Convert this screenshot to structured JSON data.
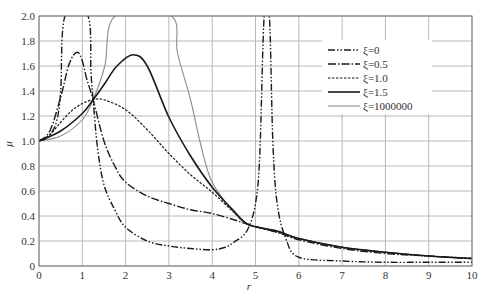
{
  "chart_data": {
    "type": "line",
    "title": "",
    "xlabel": "r",
    "ylabel": "μ",
    "xlim": [
      0,
      10
    ],
    "ylim": [
      0,
      2.0
    ],
    "grid": true,
    "legend_position": "upper right (inside)",
    "x_ticks": [
      "0",
      "1",
      "2",
      "3",
      "4",
      "5",
      "6",
      "7",
      "8",
      "9",
      "10"
    ],
    "y_ticks": [
      "0",
      "0.2",
      "0.4",
      "0.6",
      "0.8",
      "1.0",
      "1.2",
      "1.4",
      "1.6",
      "1.8",
      "2.0"
    ],
    "series": [
      {
        "name": "ξ=0",
        "style": "dash-dot-dot",
        "color": "#1a1a1a",
        "points": [
          [
            0,
            1.0
          ],
          [
            0.2,
            1.03
          ],
          [
            0.4,
            1.15
          ],
          [
            0.5,
            1.4
          ],
          [
            0.6,
            2.0
          ],
          [
            1.13,
            2.0
          ],
          [
            1.2,
            1.55
          ],
          [
            1.25,
            1.33
          ],
          [
            1.35,
            0.95
          ],
          [
            1.5,
            0.65
          ],
          [
            1.75,
            0.45
          ],
          [
            2.0,
            0.31
          ],
          [
            2.5,
            0.2
          ],
          [
            3.0,
            0.16
          ],
          [
            3.5,
            0.14
          ],
          [
            4.0,
            0.13
          ],
          [
            4.3,
            0.15
          ],
          [
            4.5,
            0.19
          ],
          [
            4.8,
            0.28
          ],
          [
            5.0,
            0.5
          ],
          [
            5.1,
            0.9
          ],
          [
            5.2,
            2.0
          ],
          [
            5.32,
            2.0
          ],
          [
            5.4,
            1.0
          ],
          [
            5.5,
            0.5
          ],
          [
            5.7,
            0.22
          ],
          [
            6.0,
            0.07
          ],
          [
            7.0,
            0.04
          ],
          [
            8.0,
            0.03
          ],
          [
            9.0,
            0.03
          ],
          [
            10.0,
            0.03
          ]
        ]
      },
      {
        "name": "ξ=0.5",
        "style": "dash-dot",
        "color": "#1a1a1a",
        "points": [
          [
            0,
            1.0
          ],
          [
            0.25,
            1.08
          ],
          [
            0.5,
            1.35
          ],
          [
            0.7,
            1.62
          ],
          [
            0.88,
            1.71
          ],
          [
            1.0,
            1.64
          ],
          [
            1.1,
            1.5
          ],
          [
            1.25,
            1.33
          ],
          [
            1.5,
            1.0
          ],
          [
            1.75,
            0.8
          ],
          [
            2.0,
            0.67
          ],
          [
            2.5,
            0.56
          ],
          [
            3.0,
            0.5
          ],
          [
            3.5,
            0.45
          ],
          [
            4.0,
            0.42
          ],
          [
            4.5,
            0.37
          ],
          [
            4.85,
            0.33
          ],
          [
            5.5,
            0.27
          ],
          [
            6.0,
            0.21
          ],
          [
            7.0,
            0.14
          ],
          [
            8.0,
            0.1
          ],
          [
            9.0,
            0.08
          ],
          [
            10.0,
            0.06
          ]
        ]
      },
      {
        "name": "ξ=1.0",
        "style": "dashed",
        "color": "#1a1a1a",
        "points": [
          [
            0,
            1.0
          ],
          [
            0.25,
            1.05
          ],
          [
            0.5,
            1.15
          ],
          [
            0.75,
            1.24
          ],
          [
            1.0,
            1.3
          ],
          [
            1.25,
            1.33
          ],
          [
            1.5,
            1.33
          ],
          [
            2.0,
            1.25
          ],
          [
            2.5,
            1.09
          ],
          [
            3.0,
            0.9
          ],
          [
            3.5,
            0.73
          ],
          [
            4.0,
            0.59
          ],
          [
            4.5,
            0.43
          ],
          [
            4.85,
            0.33
          ],
          [
            5.5,
            0.27
          ],
          [
            6.0,
            0.22
          ],
          [
            7.0,
            0.15
          ],
          [
            8.0,
            0.11
          ],
          [
            9.0,
            0.08
          ],
          [
            10.0,
            0.06
          ]
        ]
      },
      {
        "name": "ξ=1.5",
        "style": "solid",
        "color": "#1a1a1a",
        "points": [
          [
            0,
            1.0
          ],
          [
            0.5,
            1.08
          ],
          [
            1.0,
            1.22
          ],
          [
            1.25,
            1.33
          ],
          [
            1.5,
            1.45
          ],
          [
            1.8,
            1.6
          ],
          [
            2.17,
            1.69
          ],
          [
            2.5,
            1.6
          ],
          [
            3.0,
            1.19
          ],
          [
            3.5,
            0.88
          ],
          [
            4.0,
            0.63
          ],
          [
            4.5,
            0.44
          ],
          [
            4.85,
            0.33
          ],
          [
            5.5,
            0.28
          ],
          [
            6.0,
            0.22
          ],
          [
            7.0,
            0.15
          ],
          [
            8.0,
            0.11
          ],
          [
            9.0,
            0.08
          ],
          [
            10.0,
            0.06
          ]
        ]
      },
      {
        "name": "ξ=1000000",
        "style": "solid-thin",
        "color": "#8c8c8c",
        "points": [
          [
            0,
            1.0
          ],
          [
            0.5,
            1.04
          ],
          [
            1.0,
            1.17
          ],
          [
            1.25,
            1.33
          ],
          [
            1.52,
            1.6
          ],
          [
            1.76,
            2.0
          ],
          [
            3.05,
            2.0
          ],
          [
            3.2,
            1.7
          ],
          [
            3.5,
            1.33
          ],
          [
            3.75,
            0.95
          ],
          [
            4.0,
            0.67
          ],
          [
            4.5,
            0.43
          ],
          [
            4.85,
            0.33
          ],
          [
            5.5,
            0.28
          ],
          [
            6.0,
            0.22
          ],
          [
            7.0,
            0.15
          ],
          [
            8.0,
            0.11
          ],
          [
            9.0,
            0.08
          ],
          [
            10.0,
            0.06
          ]
        ]
      }
    ],
    "annotations": [
      "curves intersect near (1.25, 1.33) and (4.85, 0.33)"
    ]
  },
  "legend": {
    "items": [
      {
        "label": "ξ=0"
      },
      {
        "label": "ξ=0.5"
      },
      {
        "label": "ξ=1.0"
      },
      {
        "label": "ξ=1.5"
      },
      {
        "label": "ξ=1000000"
      }
    ]
  },
  "axes": {
    "x_label": "r",
    "y_label": "μ"
  }
}
